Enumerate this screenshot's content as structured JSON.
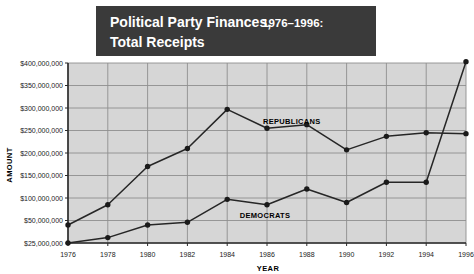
{
  "title": {
    "line1_main": "Political Party Finances,",
    "line1_years": "1976–1996:",
    "line2": "Total Receipts",
    "background_color": "#3a3a3a",
    "text_color": "#ffffff"
  },
  "axes": {
    "x_title": "YEAR",
    "y_title": "AMOUNT",
    "y_tick_labels": [
      "$25,000,000",
      "$50,000,000",
      "$100,000,000",
      "$150,000,000",
      "$200,000,000",
      "$250,000,000",
      "$300,000,000",
      "$350,000,000",
      "$400,000,000"
    ],
    "x_tick_labels": [
      "1976",
      "1978",
      "1980",
      "1982",
      "1984",
      "1986",
      "1988",
      "1990",
      "1992",
      "1994",
      "1996"
    ]
  },
  "series_labels": {
    "republicans": "REPUBLICANS",
    "democrats": "DEMOCRATS"
  },
  "colors": {
    "plot_background": "#d6d6d6",
    "gridline": "#8f8f8f",
    "axis_line": "#2a2a2a",
    "line_republicans": "#262626",
    "line_democrats": "#262626",
    "marker": "#1a1a1a",
    "page_background": "#ffffff"
  },
  "chart_data": {
    "type": "line",
    "title": "Political Party Finances, 1976–1996: Total Receipts",
    "xlabel": "YEAR",
    "ylabel": "AMOUNT",
    "x": [
      1976,
      1978,
      1980,
      1982,
      1984,
      1986,
      1988,
      1990,
      1992,
      1994,
      1996
    ],
    "xlim": [
      1976,
      1996
    ],
    "ylim": [
      25000000,
      412000000
    ],
    "y_ticks": [
      25000000,
      50000000,
      100000000,
      150000000,
      200000000,
      250000000,
      300000000,
      350000000,
      400000000
    ],
    "grid": true,
    "legend": "inline-labels",
    "series": [
      {
        "name": "REPUBLICANS",
        "values": [
          45000000,
          85000000,
          170000000,
          210000000,
          297000000,
          255000000,
          263000000,
          207000000,
          237000000,
          245000000,
          243000000
        ]
      },
      {
        "name": "DEMOCRATS",
        "values": [
          25000000,
          31000000,
          45000000,
          48000000,
          97000000,
          85000000,
          120000000,
          90000000,
          135000000,
          135000000,
          403000000
        ]
      }
    ]
  }
}
